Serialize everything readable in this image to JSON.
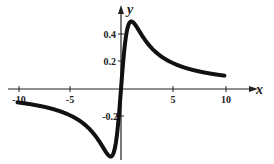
{
  "chart_data": {
    "type": "line",
    "title": "",
    "xlabel": "x",
    "ylabel": "y",
    "xlim": [
      -10,
      10
    ],
    "ylim": [
      -0.5,
      0.5
    ],
    "x_ticks": [
      "-10",
      "-5",
      "5",
      "10"
    ],
    "y_ticks": [
      "0.4",
      "0.2",
      "-0.2"
    ],
    "grid": false,
    "legend": null,
    "series": [
      {
        "name": "y = x/(x^2+1)",
        "x": [
          -10,
          -8,
          -6,
          -5,
          -4,
          -3,
          -2,
          -1,
          -0.5,
          0,
          0.5,
          1,
          2,
          3,
          4,
          5,
          6,
          8,
          10
        ],
        "values": [
          -0.099,
          -0.123,
          -0.162,
          -0.192,
          -0.235,
          -0.3,
          -0.4,
          -0.5,
          -0.4,
          0,
          0.4,
          0.5,
          0.4,
          0.3,
          0.235,
          0.192,
          0.162,
          0.123,
          0.099
        ]
      }
    ]
  }
}
